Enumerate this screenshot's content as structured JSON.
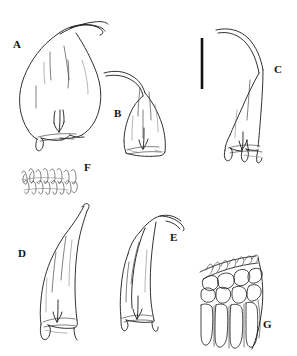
{
  "figure": {
    "kind": "botanical-line-drawing-plate",
    "background_color": "#ffffff",
    "ink_color": "#1a1a1a",
    "width_px": 297,
    "height_px": 356,
    "panel_count": 7
  },
  "panels": [
    {
      "id": "A",
      "label": "A",
      "label_x": 13,
      "label_y": 39,
      "subject": "leaf",
      "description": "broadly ovate leaf with long flexuose recurved apex and basal auricles"
    },
    {
      "id": "B",
      "label": "B",
      "label_x": 114,
      "label_y": 108,
      "subject": "leaf",
      "description": "ovate leaf with slender arcuate apex"
    },
    {
      "id": "C",
      "label": "C",
      "label_x": 274,
      "label_y": 64,
      "subject": "leaf",
      "description": "narrowly oblong leaf with strongly falcate apex and dentate base"
    },
    {
      "id": "D",
      "label": "D",
      "label_x": 18,
      "label_y": 248,
      "subject": "leaf",
      "description": "oblong-lanceolate leaf with short acuminate apex"
    },
    {
      "id": "E",
      "label": "E",
      "label_x": 170,
      "label_y": 232,
      "subject": "leaf",
      "description": "broadly oblong leaf with abruptly recurved apex"
    },
    {
      "id": "F",
      "label": "F",
      "label_x": 84,
      "label_y": 162,
      "subject": "cells",
      "description": "detail of linear vermicular laminal cells"
    },
    {
      "id": "G",
      "label": "G",
      "label_x": 263,
      "label_y": 319,
      "subject": "cells",
      "description": "detail of leaf base showing inflated alar cells and marginal cells"
    }
  ],
  "scale_bar": {
    "name": "scale-bar",
    "orientation": "vertical",
    "x": 202,
    "y_top": 38,
    "y_bottom": 89,
    "length_px": 51,
    "color": "#111111"
  }
}
